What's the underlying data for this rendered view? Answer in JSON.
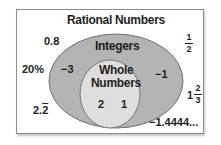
{
  "diagram": {
    "type": "venn-nested",
    "sets": [
      {
        "name": "Rational Numbers",
        "level": 0,
        "members": [
          "0.8",
          "1/2",
          "20%",
          "1 2/3",
          "2.2̅",
          "-1.4444..."
        ]
      },
      {
        "name": "Integers",
        "level": 1,
        "members": [
          "-3",
          "-1"
        ]
      },
      {
        "name": "Whole Numbers",
        "level": 2,
        "members": [
          "2",
          "1"
        ]
      }
    ],
    "colors": {
      "frame_border": "#8a8a8a",
      "integers_fill": "#b4b4b4",
      "whole_fill": "#dedede",
      "text": "#1e1e1e"
    }
  },
  "labels": {
    "rational_title": "Rational Numbers",
    "integers_title": "Integers",
    "whole_title_line1": "Whole",
    "whole_title_line2": "Numbers"
  },
  "values": {
    "v_0_8": "0.8",
    "v_20pct": "20%",
    "v_2_2_int": "2.",
    "v_2_2_rep": "2",
    "v_neg3": "−3",
    "v_neg1": "−1",
    "v_2": "2",
    "v_1": "1",
    "v_neg_1_4444": "−1.4444...",
    "half": {
      "num": "1",
      "den": "2"
    },
    "mixed": {
      "whole": "1",
      "num": "2",
      "den": "3"
    }
  }
}
